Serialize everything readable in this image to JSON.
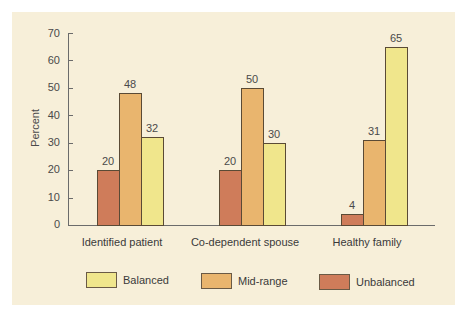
{
  "chart_data": {
    "type": "bar",
    "title": "",
    "xlabel": "",
    "ylabel": "Percent",
    "ylim": [
      0,
      70
    ],
    "yticks": [
      0,
      10,
      20,
      30,
      40,
      50,
      60,
      70
    ],
    "grid": false,
    "legend_position": "bottom",
    "categories": [
      "Identified patient",
      "Co-dependent spouse",
      "Healthy family"
    ],
    "series": [
      {
        "name": "Unbalanced",
        "color": "#cf7c5a",
        "values": [
          20,
          20,
          4
        ]
      },
      {
        "name": "Mid-range",
        "color": "#e9b56e",
        "values": [
          48,
          50,
          31
        ]
      },
      {
        "name": "Balanced",
        "color": "#f0e68c",
        "values": [
          32,
          30,
          65
        ]
      }
    ],
    "legend": [
      {
        "name": "Balanced",
        "color": "#f0e68c"
      },
      {
        "name": "Mid-range",
        "color": "#e9b56e"
      },
      {
        "name": "Unbalanced",
        "color": "#cf7c5a"
      }
    ]
  },
  "labels": {
    "ylabel": "Percent",
    "ticks": [
      "0",
      "10",
      "20",
      "30",
      "40",
      "50",
      "60",
      "70"
    ],
    "cats": [
      "Identified patient",
      "Co-dependent spouse",
      "Healthy family"
    ],
    "vals": [
      [
        "20",
        "48",
        "32"
      ],
      [
        "20",
        "50",
        "30"
      ],
      [
        "4",
        "31",
        "65"
      ]
    ],
    "legend": [
      "Balanced",
      "Mid-range",
      "Unbalanced"
    ]
  }
}
